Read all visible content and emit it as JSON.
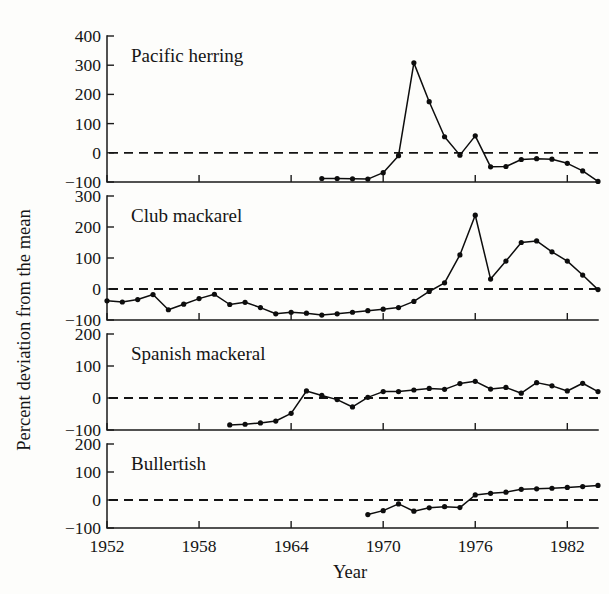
{
  "chart_data": {
    "type": "line",
    "title": "",
    "xlabel": "Year",
    "ylabel": "Percent deviation from the mean",
    "grid": false,
    "legend": "none",
    "layout": "4 stacked panels sharing one x axis",
    "xlim": [
      1952,
      1984
    ],
    "xticks": [
      1952,
      1958,
      1964,
      1970,
      1976,
      1982
    ],
    "xticklabels": [
      "1952",
      "1958",
      "1964",
      "1970",
      "1976",
      "1982"
    ],
    "zero_reference_line": 0,
    "panels": [
      {
        "name": "Pacific herring",
        "ylim": [
          -100,
          400
        ],
        "yticks": [
          -100,
          0,
          100,
          200,
          300,
          400
        ],
        "yticklabels": [
          "-100",
          "0",
          "100",
          "200",
          "300",
          "400"
        ],
        "x": [
          1966,
          1967,
          1968,
          1969,
          1970,
          1971,
          1972,
          1973,
          1974,
          1975,
          1976,
          1977,
          1978,
          1979,
          1980,
          1981,
          1982,
          1983,
          1984
        ],
        "y": [
          -88,
          -88,
          -89,
          -90,
          -68,
          -10,
          308,
          175,
          55,
          -8,
          58,
          -48,
          -47,
          -23,
          -20,
          -22,
          -36,
          -62,
          -98
        ]
      },
      {
        "name": "Club mackarel",
        "ylim": [
          -100,
          300
        ],
        "yticks": [
          -100,
          0,
          100,
          200,
          300
        ],
        "yticklabels": [
          "-100",
          "0",
          "100",
          "200",
          "300"
        ],
        "x": [
          1952,
          1953,
          1954,
          1955,
          1956,
          1957,
          1958,
          1959,
          1960,
          1961,
          1962,
          1963,
          1964,
          1965,
          1966,
          1967,
          1968,
          1969,
          1970,
          1971,
          1972,
          1973,
          1974,
          1975,
          1976,
          1977,
          1978,
          1979,
          1980,
          1981,
          1982,
          1983,
          1984
        ],
        "y": [
          -38,
          -42,
          -34,
          -18,
          -67,
          -49,
          -31,
          -17,
          -50,
          -43,
          -60,
          -80,
          -75,
          -78,
          -84,
          -80,
          -75,
          -70,
          -65,
          -60,
          -40,
          -8,
          20,
          110,
          238,
          32,
          90,
          150,
          155,
          120,
          90,
          45,
          -2
        ],
        "note": "last two points fall to about -30 and -55"
      },
      {
        "name": "Spanish mackeral",
        "ylim": [
          -100,
          200
        ],
        "yticks": [
          -100,
          0,
          100,
          200
        ],
        "yticklabels": [
          "-100",
          "0",
          "100",
          "200"
        ],
        "x": [
          1960,
          1961,
          1962,
          1963,
          1964,
          1965,
          1966,
          1967,
          1968,
          1969,
          1970,
          1971,
          1972,
          1973,
          1974,
          1975,
          1976,
          1977,
          1978,
          1979,
          1980,
          1981,
          1982,
          1983,
          1984
        ],
        "y": [
          -84,
          -82,
          -78,
          -72,
          -48,
          22,
          8,
          -5,
          -28,
          2,
          20,
          20,
          25,
          30,
          27,
          45,
          52,
          28,
          33,
          15,
          48,
          38,
          22,
          46,
          20
        ]
      },
      {
        "name": "Bullertish",
        "ylim": [
          -100,
          200
        ],
        "yticks": [
          -100,
          0,
          100,
          200
        ],
        "yticklabels": [
          "-100",
          "0",
          "100",
          "200"
        ],
        "x": [
          1969,
          1970,
          1971,
          1972,
          1973,
          1974,
          1975,
          1976,
          1977,
          1978,
          1979,
          1980,
          1981,
          1982,
          1983,
          1984
        ],
        "y": [
          -52,
          -38,
          -14,
          -40,
          -28,
          -24,
          -27,
          18,
          24,
          28,
          38,
          40,
          42,
          45,
          48,
          52
        ]
      }
    ]
  },
  "axes": {
    "ylabel": "Percent deviation from the mean",
    "xlabel": "Year"
  }
}
